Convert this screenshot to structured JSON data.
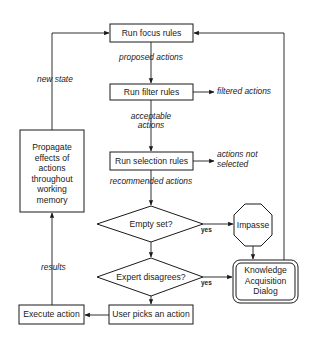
{
  "nodes": {
    "focus": "Run focus rules",
    "filter": "Run filter rules",
    "selection": "Run selection rules",
    "empty_set": "Empty set?",
    "expert": "Expert disagrees?",
    "user_picks": "User picks an action",
    "execute": "Execute action",
    "propagate": [
      "Propagate",
      "effects of",
      "actions",
      "throughout",
      "working",
      "memory"
    ],
    "impasse": "Impasse",
    "ka_dialog": [
      "Knowledge",
      "Acquisition",
      "Dialog"
    ]
  },
  "edges": {
    "proposed": "proposed actions",
    "acceptable": [
      "acceptable",
      "actions"
    ],
    "recommended": "recommended actions",
    "filtered": "filtered actions",
    "not_selected": [
      "actions not",
      "selected"
    ],
    "new_state": "new state",
    "results": "results",
    "yes1": "yes",
    "yes2": "yes"
  },
  "colors": {
    "ink": "#1a1a1a",
    "background": "#ffffff"
  }
}
